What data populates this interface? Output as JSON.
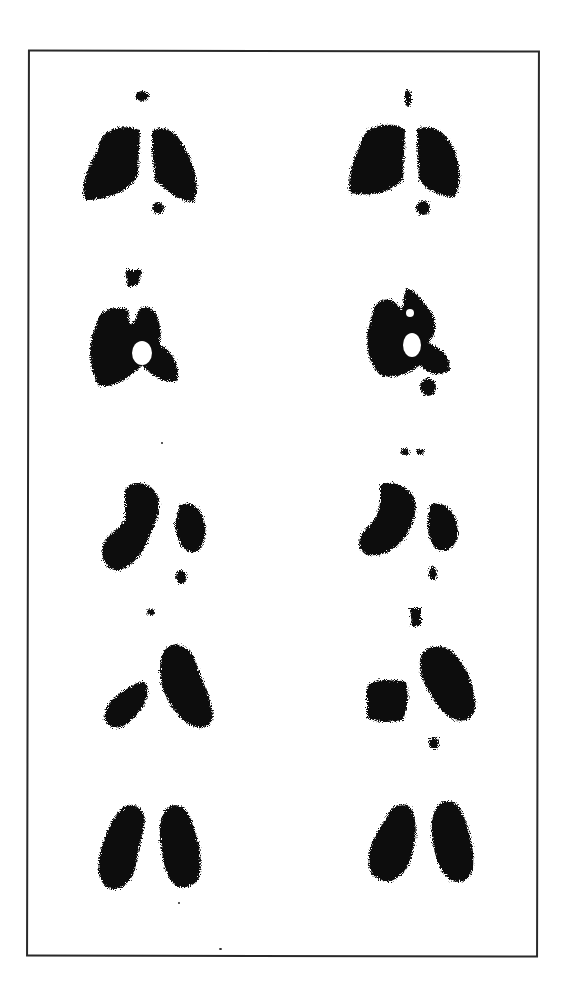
{
  "figure": {
    "ink_color": "#111111",
    "background_color": "#ffffff",
    "frame_color": "#2a2a2a",
    "columns": 2,
    "rows": 5,
    "scans": [
      {
        "row": 1,
        "col": 1,
        "view": "anterior-like",
        "left": 70,
        "top": 90
      },
      {
        "row": 1,
        "col": 2,
        "view": "anterior-like",
        "left": 335,
        "top": 85
      },
      {
        "row": 2,
        "col": 1,
        "view": "oblique",
        "left": 70,
        "top": 265
      },
      {
        "row": 2,
        "col": 2,
        "view": "oblique",
        "left": 340,
        "top": 265
      },
      {
        "row": 3,
        "col": 1,
        "view": "lateral-left",
        "left": 85,
        "top": 450
      },
      {
        "row": 3,
        "col": 2,
        "view": "lateral-left",
        "left": 345,
        "top": 445
      },
      {
        "row": 4,
        "col": 1,
        "view": "lateral-right",
        "left": 85,
        "top": 615
      },
      {
        "row": 4,
        "col": 2,
        "view": "lateral-right",
        "left": 355,
        "top": 605
      },
      {
        "row": 5,
        "col": 1,
        "view": "posterior-like",
        "left": 85,
        "top": 785
      },
      {
        "row": 5,
        "col": 2,
        "view": "posterior-like",
        "left": 355,
        "top": 780
      }
    ]
  }
}
